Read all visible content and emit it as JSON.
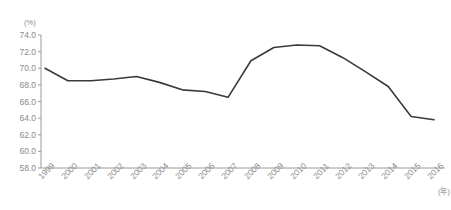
{
  "chart_data": {
    "type": "line",
    "title": "",
    "subtitle": "",
    "xlabel": "(年)",
    "ylabel": "(%)",
    "ylim": [
      58.0,
      74.0
    ],
    "ytick_step": 2.0,
    "grid": false,
    "legend": null,
    "line_color": "#3a3a3a",
    "axis_color": "#9a9a9a",
    "text_color": "#8a8a8a",
    "yticks": [
      "74.0",
      "72.0",
      "70.0",
      "68.0",
      "66.0",
      "64.0",
      "62.0",
      "60.0",
      "58.0"
    ],
    "ytick_values": [
      74.0,
      72.0,
      70.0,
      68.0,
      66.0,
      64.0,
      62.0,
      60.0,
      58.0
    ],
    "categories": [
      "1999",
      "2000",
      "2001",
      "2002",
      "2003",
      "2004",
      "2005",
      "2006",
      "2007",
      "2008",
      "2009",
      "2010",
      "2011",
      "2012",
      "2013",
      "2014",
      "2015",
      "2016"
    ],
    "x": [
      1999,
      2000,
      2001,
      2002,
      2003,
      2004,
      2005,
      2006,
      2007,
      2008,
      2009,
      2010,
      2011,
      2012,
      2013,
      2014,
      2015,
      2016
    ],
    "values": [
      70.0,
      68.5,
      68.5,
      68.7,
      69.0,
      68.3,
      67.4,
      67.2,
      66.5,
      70.9,
      72.5,
      72.8,
      72.7,
      71.3,
      69.6,
      67.8,
      64.2,
      63.8
    ],
    "series": [
      {
        "name": "",
        "values": [
          70.0,
          68.5,
          68.5,
          68.7,
          69.0,
          68.3,
          67.4,
          67.2,
          66.5,
          70.9,
          72.5,
          72.8,
          72.7,
          71.3,
          69.6,
          67.8,
          64.2,
          63.8
        ]
      }
    ]
  }
}
